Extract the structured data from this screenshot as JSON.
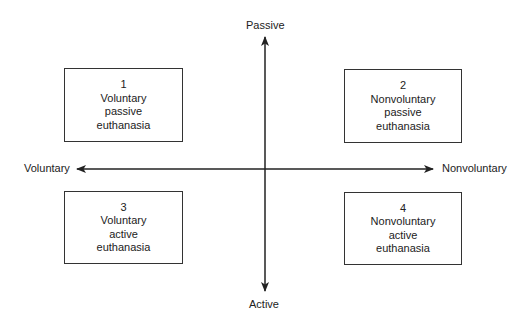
{
  "axes": {
    "vertical": {
      "top_label": "Passive",
      "bottom_label": "Active"
    },
    "horizontal": {
      "left_label": "Voluntary",
      "right_label": "Nonvoluntary"
    },
    "line_color": "#222222"
  },
  "quadrants": [
    {
      "number": "1",
      "line1": "Voluntary",
      "line2": "passive",
      "line3": "euthanasia"
    },
    {
      "number": "2",
      "line1": "Nonvoluntary",
      "line2": "passive",
      "line3": "euthanasia"
    },
    {
      "number": "3",
      "line1": "Voluntary",
      "line2": "active",
      "line3": "euthanasia"
    },
    {
      "number": "4",
      "line1": "Nonvoluntary",
      "line2": "active",
      "line3": "euthanasia"
    }
  ]
}
